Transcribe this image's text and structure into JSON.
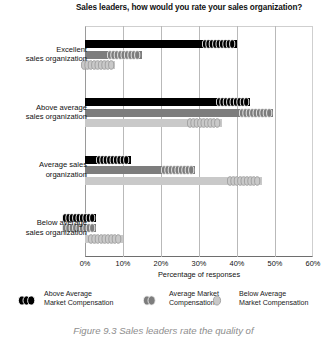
{
  "chart_data": {
    "type": "bar",
    "orientation": "horizontal",
    "title": "Sales leaders, how would you rate your sales organization?",
    "xlabel": "Percentage of responses",
    "ylabel": "",
    "xlim": [
      0,
      60
    ],
    "xticks": [
      "0%",
      "10%",
      "20%",
      "30%",
      "40%",
      "50%",
      "60%"
    ],
    "xtick_values": [
      0,
      10,
      20,
      30,
      40,
      50,
      60
    ],
    "grid": true,
    "legend_position": "bottom",
    "categories": [
      "Excellent\nsales organization",
      "Above average\nsales organization",
      "Average sales\norganization",
      "Below average\nsales organization"
    ],
    "series": [
      {
        "name": "Above Average\nMarket Compensation",
        "color": "#000000",
        "values": [
          40,
          43.5,
          12,
          3
        ]
      },
      {
        "name": "Average Market\nCompensation",
        "color": "#7d7d7d",
        "values": [
          15,
          49.5,
          29,
          3
        ]
      },
      {
        "name": "Below Average\nMarket Compensation",
        "color": "#c9c9c9",
        "values": [
          8,
          36,
          46.5,
          10
        ]
      }
    ]
  },
  "caption": "Figure 9.3 Sales leaders rate the quality of",
  "colors": {
    "series_black": "#000000",
    "series_mid_gray": "#7d7d7d",
    "series_light_gray": "#c9c9c9",
    "gridline": "#b9b9b9",
    "axis": "#6e6e6e",
    "caption_gray": "#8d8d8d"
  }
}
